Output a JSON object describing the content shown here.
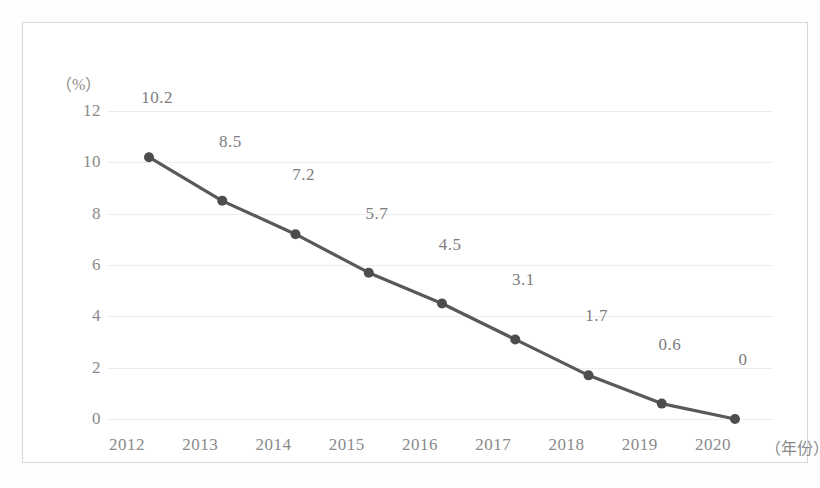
{
  "chart_data": {
    "type": "line",
    "title": "",
    "xlabel": "（年份）",
    "ylabel": "（%）",
    "categories": [
      "2012",
      "2013",
      "2014",
      "2015",
      "2016",
      "2017",
      "2018",
      "2019",
      "2020"
    ],
    "values": [
      10.2,
      8.5,
      7.2,
      5.7,
      4.5,
      3.1,
      1.7,
      0.6,
      0
    ],
    "point_labels": [
      "10.2",
      "8.5",
      "7.2",
      "5.7",
      "4.5",
      "3.1",
      "1.7",
      "0.6",
      "0"
    ],
    "ylim": [
      0,
      12
    ],
    "yticks": [
      12,
      10,
      8,
      6,
      4,
      2,
      0
    ],
    "ytick_labels": [
      "12",
      "10",
      "8",
      "6",
      "4",
      "2",
      "0"
    ],
    "grid": true,
    "legend": "none",
    "series_color": "#595959",
    "marker_color": "#4d4d4d",
    "grid_color": "#ededed",
    "tick_text_color": "#8a8a8a",
    "label_text_color": "#7d7d7d",
    "frame_color": "#d9d9d9",
    "background_color": "#ffffff"
  }
}
